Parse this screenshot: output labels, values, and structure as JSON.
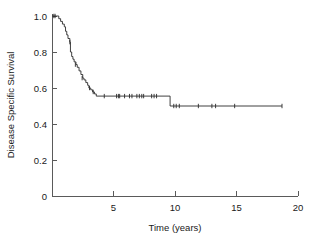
{
  "figure": {
    "title": "",
    "background_color": "#ffffff",
    "curve_color": "#2b2b2b",
    "axis_color": "#5a5a5a",
    "text_color": "#1a1a1a"
  },
  "chart_data": {
    "type": "line",
    "subtype": "kaplan-meier-survival-curve",
    "title": "",
    "xlabel": "Time (years)",
    "ylabel": "Disease Specific Survival",
    "xlim": [
      0,
      20
    ],
    "ylim": [
      0,
      1.0
    ],
    "xticks": [
      0,
      5,
      10,
      15,
      20
    ],
    "xticklabels": [
      "",
      "5",
      "10",
      "15",
      "20"
    ],
    "yticks": [
      0,
      0.2,
      0.4,
      0.6,
      0.8,
      1.0
    ],
    "yticklabels": [
      "0",
      "0.2",
      "0.4",
      "0.6",
      "0.8",
      "1.0"
    ],
    "grid": false,
    "legend": false,
    "series": [
      {
        "name": "Disease Specific Survival",
        "step": "post",
        "x": [
          0.0,
          0.35,
          0.55,
          0.7,
          0.85,
          1.0,
          1.1,
          1.2,
          1.3,
          1.45,
          1.5,
          1.6,
          1.7,
          1.8,
          1.95,
          2.05,
          2.2,
          2.35,
          2.5,
          2.6,
          2.75,
          2.9,
          3.0,
          3.15,
          3.3,
          3.45,
          3.6,
          9.6,
          18.7
        ],
        "y": [
          1.0,
          1.0,
          0.985,
          0.97,
          0.955,
          0.94,
          0.915,
          0.895,
          0.875,
          0.855,
          0.8,
          0.775,
          0.76,
          0.745,
          0.73,
          0.715,
          0.695,
          0.675,
          0.655,
          0.645,
          0.63,
          0.615,
          0.6,
          0.59,
          0.578,
          0.567,
          0.555,
          0.5,
          0.5
        ]
      }
    ],
    "censored_points": [
      {
        "x": 0.15,
        "y": 1.0
      },
      {
        "x": 0.25,
        "y": 1.0
      },
      {
        "x": 1.45,
        "y": 0.855
      },
      {
        "x": 1.9,
        "y": 0.73
      },
      {
        "x": 2.45,
        "y": 0.655
      },
      {
        "x": 3.05,
        "y": 0.6
      },
      {
        "x": 3.35,
        "y": 0.578
      },
      {
        "x": 4.25,
        "y": 0.555
      },
      {
        "x": 5.25,
        "y": 0.555
      },
      {
        "x": 5.4,
        "y": 0.555
      },
      {
        "x": 5.5,
        "y": 0.555
      },
      {
        "x": 5.9,
        "y": 0.555
      },
      {
        "x": 6.3,
        "y": 0.555
      },
      {
        "x": 6.5,
        "y": 0.555
      },
      {
        "x": 6.9,
        "y": 0.555
      },
      {
        "x": 7.1,
        "y": 0.555
      },
      {
        "x": 7.3,
        "y": 0.555
      },
      {
        "x": 7.45,
        "y": 0.555
      },
      {
        "x": 8.1,
        "y": 0.555
      },
      {
        "x": 8.3,
        "y": 0.555
      },
      {
        "x": 8.5,
        "y": 0.555
      },
      {
        "x": 9.9,
        "y": 0.5
      },
      {
        "x": 10.1,
        "y": 0.5
      },
      {
        "x": 10.35,
        "y": 0.5
      },
      {
        "x": 11.9,
        "y": 0.5
      },
      {
        "x": 13.0,
        "y": 0.5
      },
      {
        "x": 13.3,
        "y": 0.5
      },
      {
        "x": 14.85,
        "y": 0.5
      },
      {
        "x": 18.7,
        "y": 0.5
      }
    ],
    "annotations": [],
    "plateau_values": [
      0.555,
      0.5
    ],
    "final_survival": 0.5
  }
}
